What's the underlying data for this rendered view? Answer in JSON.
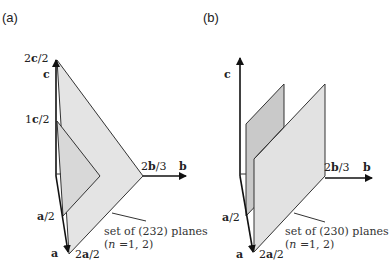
{
  "figure": {
    "panel_a": {
      "label": "(a)",
      "axes": {
        "c": "c",
        "b": "b",
        "a": "a"
      },
      "ticks": {
        "c_top_num": "2",
        "c_top_vec": "c",
        "c_top_den": "/2",
        "c_mid_num": "1",
        "c_mid_vec": "c",
        "c_mid_den": "/2",
        "b_num": "2",
        "b_vec": "b",
        "b_den": "/3",
        "a_half_vec": "a",
        "a_half_den": "/2",
        "a_full_num": "2",
        "a_full_vec": "a",
        "a_full_den": "/2"
      },
      "caption_line1": "set of (232) planes",
      "caption_line2_pre": "(",
      "caption_n": "n",
      "caption_line2_post": " =1, 2)",
      "colors": {
        "plane_fill": "#e4e4e4",
        "inner_plane_fill": "#d6d6d6",
        "stroke": "#333333"
      }
    },
    "panel_b": {
      "label": "(b)",
      "axes": {
        "c": "c",
        "b": "b",
        "a": "a"
      },
      "ticks": {
        "b_num": "2",
        "b_vec": "b",
        "b_den": "/3",
        "a_half_vec": "a",
        "a_half_den": "/2",
        "a_full_num": "2",
        "a_full_vec": "a",
        "a_full_den": "/2"
      },
      "caption_line1": "set of (230) planes",
      "caption_line2_pre": "(",
      "caption_n": "n",
      "caption_line2_post": " =1, 2)",
      "colors": {
        "plane_fill_back": "#c8c8c8",
        "plane_fill_front": "#e2e2e2",
        "stroke": "#333333"
      }
    }
  }
}
